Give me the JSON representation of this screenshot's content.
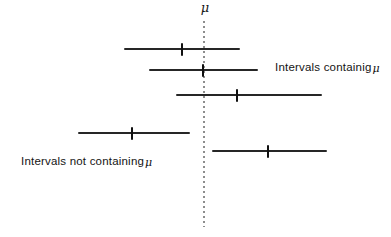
{
  "figure": {
    "mu_symbol": "μ",
    "labels": {
      "containing_text": "Intervals containig",
      "containing_mu": "μ",
      "not_containing_text": "Intervals not containing",
      "not_containing_mu": "μ"
    },
    "colors": {
      "background": "#ffffff",
      "interval_line": "#262626",
      "mean_tick": "#101010",
      "dotted_mu_line": "#8d8d8d",
      "text": "#141414"
    },
    "mu_line": {
      "x": 203,
      "y1": 21,
      "y2": 227
    },
    "intervals": [
      {
        "x1": 124,
        "x2": 240,
        "y": 49,
        "mean_x": 182,
        "contains_mu": true
      },
      {
        "x1": 149,
        "x2": 258,
        "y": 70,
        "mean_x": 203,
        "contains_mu": true
      },
      {
        "x1": 176,
        "x2": 322,
        "y": 95,
        "mean_x": 237,
        "contains_mu": true
      },
      {
        "x1": 78,
        "x2": 190,
        "y": 133,
        "mean_x": 132,
        "contains_mu": false
      },
      {
        "x1": 212,
        "x2": 327,
        "y": 151,
        "mean_x": 268,
        "contains_mu": false
      }
    ]
  }
}
